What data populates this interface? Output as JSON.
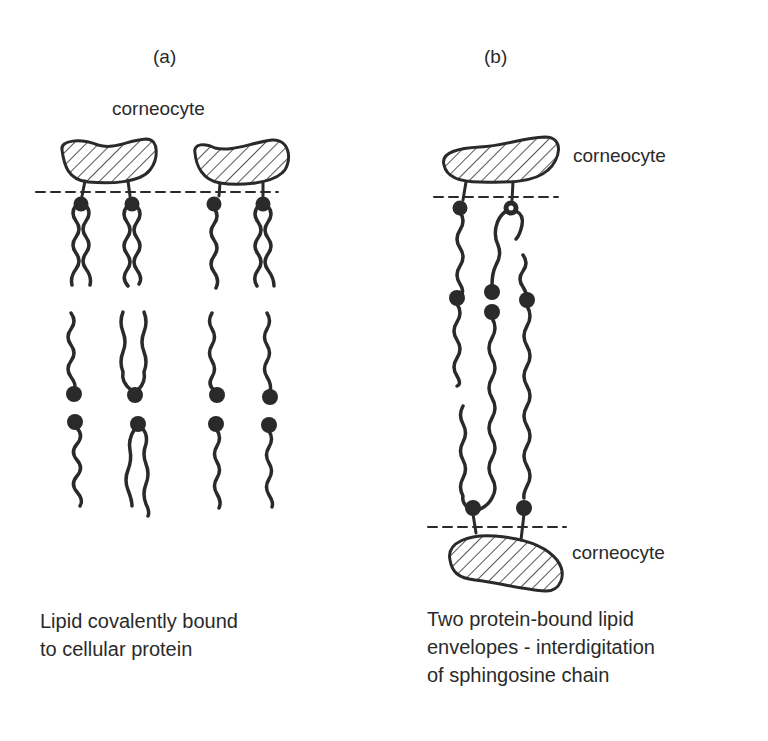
{
  "panels": {
    "a": {
      "label": "(a)",
      "corneocyte_label": "corneocyte",
      "caption_lines": [
        "Lipid covalently bound",
        "to cellular protein"
      ]
    },
    "b": {
      "label": "(b)",
      "corneocyte_top_label": "corneocyte",
      "corneocyte_bottom_label": "corneocyte",
      "caption_lines": [
        "Two protein-bound lipid",
        "envelopes - interdigitation",
        "of sphingosine chain"
      ]
    }
  },
  "colors": {
    "ink": "#2a2a2a",
    "background": "#ffffff"
  }
}
